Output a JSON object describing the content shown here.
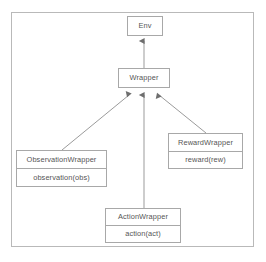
{
  "diagram": {
    "type": "uml-class-inheritance",
    "title": "",
    "frame": {
      "border_color": "#b9b9b9"
    },
    "style": {
      "node_border_color": "#a8a8a8",
      "node_fill": "#ffffff",
      "text_color": "#555555",
      "edge_color": "#8f8f8f",
      "arrowhead": "filled-triangle"
    },
    "nodes": [
      {
        "id": "env",
        "name": "Env",
        "title": "Env",
        "members": []
      },
      {
        "id": "wrapper",
        "name": "Wrapper",
        "title": "Wrapper",
        "members": []
      },
      {
        "id": "observation_wrapper",
        "name": "ObservationWrapper",
        "title": "ObservationWrapper",
        "members": [
          "observation(obs)"
        ]
      },
      {
        "id": "reward_wrapper",
        "name": "RewardWrapper",
        "title": "RewardWrapper",
        "members": [
          "reward(rew)"
        ]
      },
      {
        "id": "action_wrapper",
        "name": "ActionWrapper",
        "title": "ActionWrapper",
        "members": [
          "action(act)"
        ]
      }
    ],
    "edges": [
      {
        "from": "wrapper",
        "to": "env",
        "relation": "inheritance"
      },
      {
        "from": "observation_wrapper",
        "to": "wrapper",
        "relation": "inheritance"
      },
      {
        "from": "action_wrapper",
        "to": "wrapper",
        "relation": "inheritance"
      },
      {
        "from": "reward_wrapper",
        "to": "wrapper",
        "relation": "inheritance"
      }
    ]
  }
}
